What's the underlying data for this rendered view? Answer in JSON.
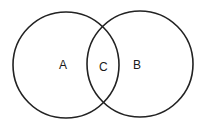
{
  "diagram": {
    "type": "venn",
    "circles": [
      {
        "id": "A",
        "label": "A",
        "cx": 66,
        "cy": 65,
        "r": 53
      },
      {
        "id": "B",
        "label": "B",
        "cx": 140,
        "cy": 64,
        "r": 53
      }
    ],
    "intersection": {
      "label": "C"
    },
    "stroke_color": "#222222",
    "background": "#ffffff"
  }
}
